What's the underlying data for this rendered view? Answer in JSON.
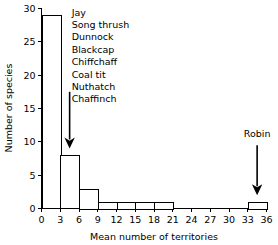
{
  "chart_data": {
    "type": "bar",
    "title": "",
    "xlabel": "Mean number of territories",
    "ylabel": "Number of species",
    "xlim": [
      0,
      36
    ],
    "ylim": [
      0,
      30
    ],
    "xticks": [
      0,
      3,
      6,
      9,
      12,
      15,
      18,
      21,
      24,
      27,
      30,
      33,
      36
    ],
    "yticks": [
      0,
      5,
      10,
      15,
      20,
      25,
      30
    ],
    "grid": false,
    "legend": false,
    "bin_width": 3,
    "bins": [
      {
        "x0": 0,
        "x1": 3,
        "value": 29
      },
      {
        "x0": 3,
        "x1": 6,
        "value": 8
      },
      {
        "x0": 6,
        "x1": 9,
        "value": 3
      },
      {
        "x0": 9,
        "x1": 12,
        "value": 1
      },
      {
        "x0": 12,
        "x1": 15,
        "value": 1
      },
      {
        "x0": 15,
        "x1": 18,
        "value": 1
      },
      {
        "x0": 18,
        "x1": 21,
        "value": 1
      },
      {
        "x0": 21,
        "x1": 24,
        "value": 0
      },
      {
        "x0": 24,
        "x1": 27,
        "value": 0
      },
      {
        "x0": 27,
        "x1": 30,
        "value": 0
      },
      {
        "x0": 30,
        "x1": 33,
        "value": 0
      },
      {
        "x0": 33,
        "x1": 36,
        "value": 1
      }
    ],
    "categories": [
      "0-3",
      "3-6",
      "6-9",
      "9-12",
      "12-15",
      "15-18",
      "18-21",
      "21-24",
      "24-27",
      "27-30",
      "30-33",
      "33-36"
    ],
    "values": [
      29,
      8,
      3,
      1,
      1,
      1,
      1,
      0,
      0,
      0,
      0,
      1
    ],
    "annotations": [
      {
        "name": "species-list-annotation",
        "labels": [
          "Jay",
          "Song thrush",
          "Dunnock",
          "Blackcap",
          "Chiffchaff",
          "Coal tit",
          "Nuthatch",
          "Chaffinch"
        ],
        "arrow_target_x": 4.5,
        "arrow_from_y": 17.5,
        "arrow_to_y": 9.0
      },
      {
        "name": "robin-annotation",
        "labels": [
          "Robin"
        ],
        "arrow_target_x": 34.5,
        "arrow_from_y": 9.5,
        "arrow_to_y": 2.0
      }
    ]
  }
}
